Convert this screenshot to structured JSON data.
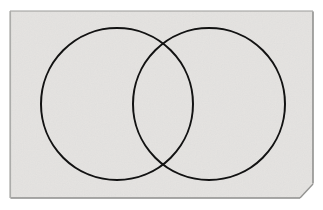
{
  "document": {
    "kind": "scanned-figure",
    "title": "Two overlapping circles (Venn diagram)",
    "canvas": {
      "width": 323,
      "height": 210
    },
    "background_color": "#ffffff"
  },
  "page": {
    "name": "paper-sheet",
    "fill_color": "#e4e3e1",
    "border_color": "#9a9a98",
    "border_width": 1,
    "left": 10,
    "top": 11,
    "right": 313,
    "bottom": 198,
    "clipped_corner": {
      "corner": "bottom-right",
      "from_x": 300,
      "from_y": 198,
      "to_x": 313,
      "to_y": 184
    },
    "polygon_points": "10,11 313,11 313,184 300,198 10,198"
  },
  "diagram": {
    "name": "venn-diagram",
    "type": "two-set-venn",
    "stroke_color": "#121212",
    "stroke_width": 2,
    "fill": "none",
    "shapes": [
      {
        "id": "left-circle",
        "label": "Set A",
        "cx": 117,
        "cy": 104,
        "r": 76
      },
      {
        "id": "right-circle",
        "label": "Set B",
        "cx": 209,
        "cy": 104,
        "r": 76
      }
    ],
    "intersection_points": [
      {
        "x": 163,
        "y": 25
      },
      {
        "x": 163,
        "y": 183
      }
    ],
    "regions": [
      {
        "id": "left-only",
        "label": "A only"
      },
      {
        "id": "overlap",
        "label": "A and B"
      },
      {
        "id": "right-only",
        "label": "B only"
      }
    ],
    "labels": []
  }
}
